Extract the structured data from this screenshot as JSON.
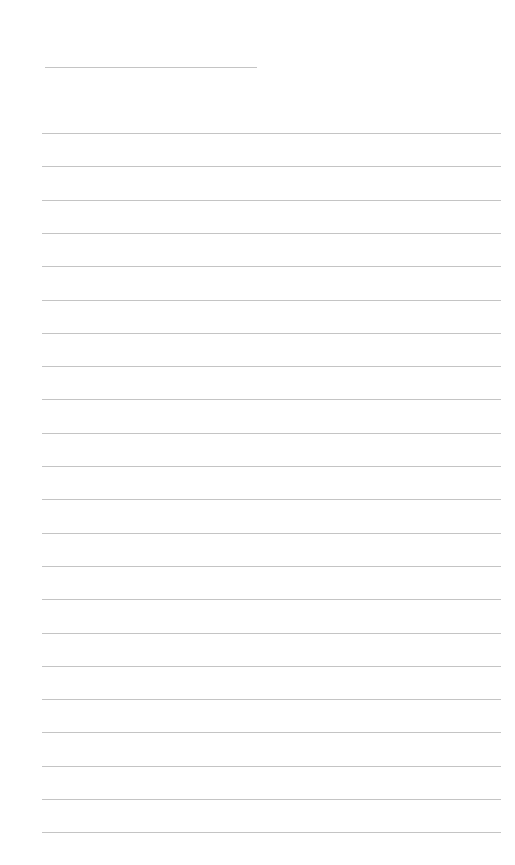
{
  "page": {
    "background": "#ffffff",
    "rule_color": "#c4c4c4",
    "title_line": {
      "value": "",
      "x": 45,
      "y": 67,
      "width": 212
    },
    "ruled_lines": {
      "count": 22,
      "x": 42,
      "width": 459,
      "first_y": 133,
      "spacing": 33.3,
      "values": [
        "",
        "",
        "",
        "",
        "",
        "",
        "",
        "",
        "",
        "",
        "",
        "",
        "",
        "",
        "",
        "",
        "",
        "",
        "",
        "",
        "",
        ""
      ]
    }
  }
}
